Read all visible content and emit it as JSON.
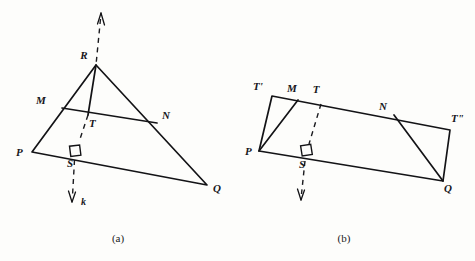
{
  "page": {
    "background_color": "#fdfdfb",
    "ink_color": "#131316",
    "width": 475,
    "height": 261
  },
  "figures": [
    {
      "id": "figure-a",
      "caption": "(a)",
      "description": "Triangle PQR with midsegment MN, cevian RT and perpendicular line k through S",
      "vertex_labels": [
        "R",
        "M",
        "T",
        "N",
        "P",
        "S",
        "Q"
      ],
      "ray_label": "k",
      "right_angle_at": "S",
      "points": {
        "R": {
          "label": "R",
          "x": 96,
          "y": 65,
          "label_x": 84,
          "label_y": 59
        },
        "M": {
          "label": "M",
          "x": 62,
          "y": 108,
          "label_x": 41,
          "label_y": 104
        },
        "T": {
          "label": "T",
          "x": 88,
          "y": 115,
          "label_x": 89,
          "label_y": 127
        },
        "N": {
          "label": "N",
          "x": 157,
          "y": 123,
          "label_x": 162,
          "label_y": 119
        },
        "P": {
          "label": "P",
          "x": 32,
          "y": 152,
          "label_x": 16,
          "label_y": 156
        },
        "S": {
          "label": "S",
          "x": 75,
          "y": 150,
          "label_x": 67,
          "label_y": 167
        },
        "Q": {
          "label": "Q",
          "x": 207,
          "y": 185,
          "label_x": 213,
          "label_y": 192
        }
      },
      "ray": {
        "label": "k",
        "label_x": 81,
        "label_y": 205,
        "arrow_top": {
          "x": 101,
          "y": 13
        },
        "arrow_bottom": {
          "x": 72,
          "y": 202
        }
      }
    },
    {
      "id": "figure-b",
      "caption": "(b)",
      "description": "Parallelogram T'T\"QP with points M, T, N on top edge, S on bottom edge, dashed perpendicular through T and S",
      "vertex_labels": [
        "T'",
        "M",
        "T",
        "N",
        "T\"",
        "P",
        "S",
        "Q"
      ],
      "right_angle_at": "S",
      "points": {
        "Tprime": {
          "label": "T'",
          "x": 272,
          "y": 96,
          "label_x": 258,
          "label_y": 90
        },
        "M": {
          "label": "M",
          "x": 298,
          "y": 100,
          "label_x": 292,
          "label_y": 92
        },
        "T": {
          "label": "T",
          "x": 321,
          "y": 103,
          "label_x": 316,
          "label_y": 93
        },
        "N": {
          "label": "N",
          "x": 394,
          "y": 115,
          "label_x": 383,
          "label_y": 110
        },
        "Tsecond": {
          "label": "T\"",
          "x": 450,
          "y": 130,
          "label_x": 451,
          "label_y": 122
        },
        "P": {
          "label": "P",
          "x": 259,
          "y": 151,
          "label_x": 245,
          "label_y": 155
        },
        "S": {
          "label": "S",
          "x": 306,
          "y": 152,
          "label_x": 299,
          "label_y": 168
        },
        "Q": {
          "label": "Q",
          "x": 443,
          "y": 181,
          "label_x": 444,
          "label_y": 192
        }
      },
      "ray": {
        "arrow_bottom": {
          "x": 301,
          "y": 200
        }
      }
    }
  ],
  "captions": [
    {
      "text": "(a)",
      "x": 118,
      "y": 242
    },
    {
      "text": "(b)",
      "x": 344,
      "y": 242
    }
  ]
}
